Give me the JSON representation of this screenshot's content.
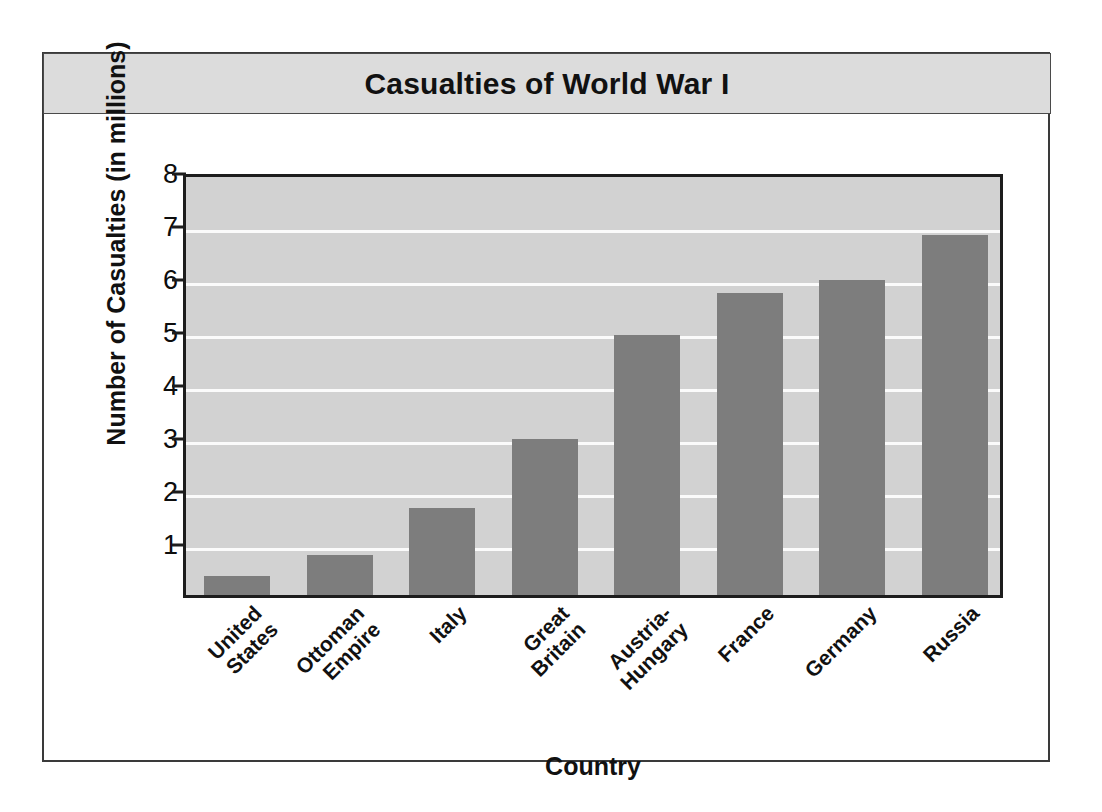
{
  "chart_data": {
    "type": "bar",
    "title": "Casualties of World War I",
    "xlabel": "Country",
    "ylabel": "Number of Casualties (in millions)",
    "categories": [
      "United States",
      "Ottoman Empire",
      "Italy",
      "Great Britain",
      "Austria-Hungary",
      "France",
      "Germany",
      "Russia"
    ],
    "category_lines": [
      [
        "United",
        "States"
      ],
      [
        "Ottoman",
        "Empire"
      ],
      [
        "Italy"
      ],
      [
        "Great",
        "Britain"
      ],
      [
        "Austria-",
        "Hungary"
      ],
      [
        "France"
      ],
      [
        "Germany"
      ],
      [
        "Russia"
      ]
    ],
    "values": [
      0.35,
      0.75,
      1.65,
      2.95,
      4.9,
      5.7,
      5.95,
      6.8
    ],
    "ylim": [
      0,
      8
    ],
    "yticks": [
      1,
      2,
      3,
      4,
      5,
      6,
      7,
      8
    ],
    "ytick_labels": [
      "1",
      "2",
      "3",
      "4",
      "5",
      "6",
      "7",
      "8"
    ],
    "grid": true,
    "legend": "none",
    "bar_color": "#7d7d7d",
    "plot_background": "#d2d2d2",
    "gridline_color": "#fbfbfb",
    "axis_color": "#1d1d1d",
    "title_banner_color": "#dcdcdc"
  }
}
